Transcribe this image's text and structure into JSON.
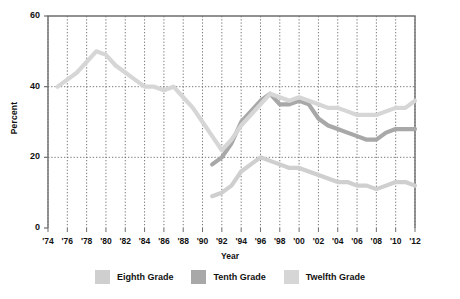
{
  "chart_data": {
    "type": "line",
    "title": "",
    "xlabel": "Year",
    "ylabel": "Percent",
    "ylim": [
      0,
      60
    ],
    "yticks": [
      0,
      20,
      40,
      60
    ],
    "xlim": [
      1974,
      2012
    ],
    "grid": true,
    "grid_style": "dotted",
    "legend_position": "bottom",
    "x": [
      1974,
      1975,
      1976,
      1977,
      1978,
      1979,
      1980,
      1981,
      1982,
      1983,
      1984,
      1985,
      1986,
      1987,
      1988,
      1989,
      1990,
      1991,
      1992,
      1993,
      1994,
      1995,
      1996,
      1997,
      1998,
      1999,
      2000,
      2001,
      2002,
      2003,
      2004,
      2005,
      2006,
      2007,
      2008,
      2009,
      2010,
      2011,
      2012
    ],
    "xtick_labels": [
      "'74",
      "'76",
      "'78",
      "'80",
      "'82",
      "'84",
      "'86",
      "'88",
      "'90",
      "'92",
      "'94",
      "'96",
      "'98",
      "'00",
      "'02",
      "'04",
      "'06",
      "'08",
      "'10",
      "'12"
    ],
    "xtick_values": [
      1974,
      1976,
      1978,
      1980,
      1982,
      1984,
      1986,
      1988,
      1990,
      1992,
      1994,
      1996,
      1998,
      2000,
      2002,
      2004,
      2006,
      2008,
      2010,
      2012
    ],
    "series": [
      {
        "name": "Eighth Grade",
        "color": "#cfcfcf",
        "x": [
          1991,
          1992,
          1993,
          1994,
          1995,
          1996,
          1997,
          1998,
          1999,
          2000,
          2001,
          2002,
          2003,
          2004,
          2005,
          2006,
          2007,
          2008,
          2009,
          2010,
          2011,
          2012
        ],
        "values": [
          9,
          10,
          12,
          16,
          18,
          20,
          19,
          18,
          17,
          17,
          16,
          15,
          14,
          13,
          13,
          12,
          12,
          11,
          12,
          13,
          13,
          12
        ]
      },
      {
        "name": "Tenth Grade",
        "color": "#a8a8a8",
        "x": [
          1991,
          1992,
          1993,
          1994,
          1995,
          1996,
          1997,
          1998,
          1999,
          2000,
          2001,
          2002,
          2003,
          2004,
          2005,
          2006,
          2007,
          2008,
          2009,
          2010,
          2011,
          2012
        ],
        "values": [
          18,
          20,
          24,
          30,
          33,
          36,
          38,
          35,
          35,
          36,
          35,
          31,
          29,
          28,
          27,
          26,
          25,
          25,
          27,
          28,
          28,
          28
        ]
      },
      {
        "name": "Twelfth Grade",
        "color": "#d6d6d6",
        "x": [
          1975,
          1976,
          1977,
          1978,
          1979,
          1980,
          1981,
          1982,
          1983,
          1984,
          1985,
          1986,
          1987,
          1988,
          1989,
          1990,
          1991,
          1992,
          1993,
          1994,
          1995,
          1996,
          1997,
          1998,
          1999,
          2000,
          2001,
          2002,
          2003,
          2004,
          2005,
          2006,
          2007,
          2008,
          2009,
          2010,
          2011,
          2012
        ],
        "values": [
          40,
          42,
          44,
          47,
          50,
          49,
          46,
          44,
          42,
          40,
          40,
          39,
          40,
          37,
          34,
          30,
          26,
          22,
          25,
          29,
          32,
          35,
          38,
          37,
          36,
          37,
          36,
          35,
          34,
          34,
          33,
          32,
          32,
          32,
          33,
          34,
          34,
          36
        ]
      }
    ]
  },
  "axes": {
    "y_title": "Percent",
    "x_title": "Year",
    "y_tick_labels": [
      "0",
      "20",
      "40",
      "60"
    ]
  },
  "legend": {
    "items": [
      {
        "label": "Eighth Grade",
        "color": "#cfcfcf"
      },
      {
        "label": "Tenth Grade",
        "color": "#a8a8a8"
      },
      {
        "label": "Twelfth Grade",
        "color": "#d6d6d6"
      }
    ]
  }
}
